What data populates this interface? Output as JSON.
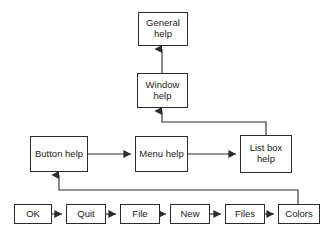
{
  "diagram": {
    "background_color": "#ffffff",
    "line_color": "#2b2b2b",
    "text_color": "#1a1a1a",
    "nodes": [
      {
        "id": "general-help",
        "label": "General\nhelp",
        "x": 138,
        "y": 12,
        "w": 50,
        "h": 34
      },
      {
        "id": "window-help",
        "label": "Window\nhelp",
        "x": 137,
        "y": 73,
        "w": 51,
        "h": 35
      },
      {
        "id": "button-help",
        "label": "Button help",
        "x": 30,
        "y": 136,
        "w": 58,
        "h": 36
      },
      {
        "id": "menu-help",
        "label": "Menu help",
        "x": 135,
        "y": 136,
        "w": 53,
        "h": 36
      },
      {
        "id": "list-box-help",
        "label": "List box\nhelp",
        "x": 240,
        "y": 135,
        "w": 52,
        "h": 38
      },
      {
        "id": "ok",
        "label": "OK",
        "x": 14,
        "y": 204,
        "w": 38,
        "h": 20
      },
      {
        "id": "quit",
        "label": "Quit",
        "x": 66,
        "y": 204,
        "w": 40,
        "h": 20
      },
      {
        "id": "file",
        "label": "File",
        "x": 120,
        "y": 204,
        "w": 40,
        "h": 20
      },
      {
        "id": "new",
        "label": "New",
        "x": 170,
        "y": 204,
        "w": 40,
        "h": 20
      },
      {
        "id": "files",
        "label": "Files",
        "x": 225,
        "y": 204,
        "w": 40,
        "h": 20
      },
      {
        "id": "colors",
        "label": "Colors",
        "x": 278,
        "y": 204,
        "w": 42,
        "h": 20
      }
    ],
    "edges": [
      {
        "id": "window-to-general",
        "from": "window-help",
        "to": "general-help",
        "kind": "vertical"
      },
      {
        "id": "listbox-to-window",
        "from": "list-box-help",
        "to": "window-help",
        "kind": "elbow-up"
      },
      {
        "id": "button-to-menu",
        "from": "button-help",
        "to": "menu-help",
        "kind": "horizontal"
      },
      {
        "id": "menu-to-listbox",
        "from": "menu-help",
        "to": "list-box-help",
        "kind": "horizontal"
      },
      {
        "id": "colors-to-button",
        "from": "colors",
        "to": "button-help",
        "kind": "feedback-loop"
      },
      {
        "id": "ok-to-quit",
        "from": "ok",
        "to": "quit",
        "kind": "horizontal"
      },
      {
        "id": "quit-to-file",
        "from": "quit",
        "to": "file",
        "kind": "horizontal"
      },
      {
        "id": "file-to-new",
        "from": "file",
        "to": "new",
        "kind": "horizontal"
      },
      {
        "id": "new-to-files",
        "from": "new",
        "to": "files",
        "kind": "horizontal"
      },
      {
        "id": "files-to-colors",
        "from": "files",
        "to": "colors",
        "kind": "horizontal"
      }
    ]
  }
}
